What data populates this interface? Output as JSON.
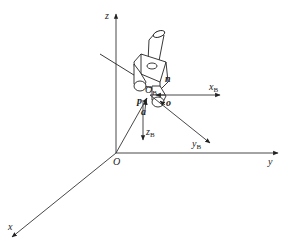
{
  "diagram": {
    "title": "",
    "base_frame": {
      "origin_label": "O",
      "axes": [
        {
          "name": "x",
          "label": "x"
        },
        {
          "name": "y",
          "label": "y"
        },
        {
          "name": "z",
          "label": "z"
        }
      ]
    },
    "tool_frame": {
      "origin_label": "O",
      "origin_sub": "B",
      "axes": [
        {
          "name": "xB",
          "label": "x",
          "sub": "B"
        },
        {
          "name": "yB",
          "label": "y",
          "sub": "B"
        },
        {
          "name": "zB",
          "label": "z",
          "sub": "B"
        }
      ]
    },
    "vectors": [
      {
        "name": "n",
        "label": "n"
      },
      {
        "name": "o",
        "label": "o"
      },
      {
        "name": "a",
        "label": "a"
      },
      {
        "name": "p",
        "label": "p"
      }
    ],
    "colors": {
      "line": "#222222",
      "background": "#ffffff"
    }
  }
}
